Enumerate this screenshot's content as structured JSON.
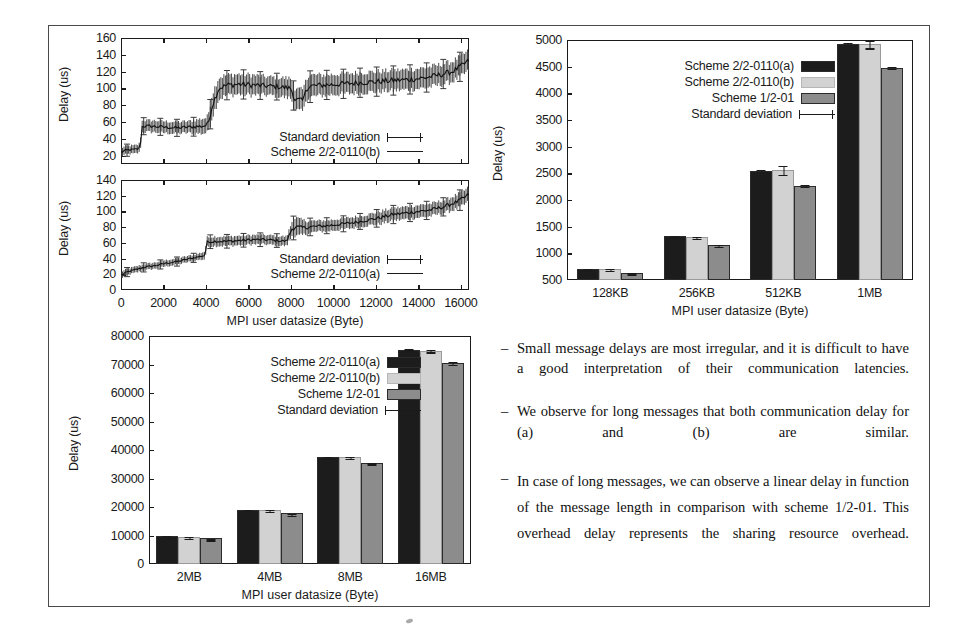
{
  "figure": {
    "axis_color": "#1a1a1a",
    "colors": {
      "scheme_a": "#1c1c1c",
      "scheme_b": "#d2d2d2",
      "scheme_c": "#8c8c8c",
      "frame": "#4a4a4a"
    }
  },
  "chart_data": [
    {
      "id": "line-top",
      "type": "line",
      "title": "",
      "xlabel": "",
      "ylabel": "Delay (us)",
      "xlim": [
        0,
        16384
      ],
      "ylim": [
        10,
        160
      ],
      "yticks": [
        "20",
        "40",
        "60",
        "80",
        "100",
        "120",
        "140",
        "160"
      ],
      "xticks": [],
      "grid": false,
      "legend_position": "bottom-right",
      "legend": [
        "Standard deviation",
        "Scheme 2/2-0110(b)"
      ],
      "series": [
        {
          "name": "Scheme 2/2-0110(b)",
          "x": [
            0,
            200,
            400,
            600,
            800,
            900,
            1000,
            1400,
            2000,
            2600,
            3200,
            3800,
            4000,
            4100,
            4300,
            4600,
            5000,
            5600,
            6200,
            6800,
            7400,
            8000,
            8200,
            8400,
            8500,
            8600,
            8700,
            9000,
            9600,
            10200,
            10800,
            11400,
            12000,
            12600,
            13200,
            13800,
            14400,
            15000,
            15600,
            16100,
            16384
          ],
          "values": [
            24,
            26,
            27,
            27,
            28,
            30,
            55,
            55,
            54,
            53,
            54,
            55,
            56,
            58,
            80,
            100,
            104,
            105,
            104,
            103,
            102,
            100,
            86,
            86,
            85,
            86,
            100,
            103,
            104,
            105,
            106,
            107,
            108,
            109,
            110,
            111,
            113,
            116,
            120,
            128,
            133
          ],
          "std": [
            5,
            5,
            5,
            5,
            5,
            6,
            7,
            7,
            7,
            7,
            7,
            9,
            9,
            10,
            14,
            13,
            12,
            12,
            12,
            11,
            11,
            12,
            12,
            13,
            13,
            13,
            13,
            13,
            12,
            12,
            12,
            12,
            12,
            12,
            12,
            12,
            12,
            12,
            12,
            12,
            12
          ]
        }
      ]
    },
    {
      "id": "line-bottom",
      "type": "line",
      "title": "",
      "xlabel": "MPI user datasize (Byte)",
      "ylabel": "Delay (us)",
      "xlim": [
        0,
        16384
      ],
      "ylim": [
        0,
        140
      ],
      "yticks": [
        "0",
        "20",
        "40",
        "60",
        "80",
        "100",
        "120",
        "140"
      ],
      "xticks": [
        "0",
        "2000",
        "4000",
        "6000",
        "8000",
        "10000",
        "12000",
        "14000",
        "16000"
      ],
      "grid": false,
      "legend_position": "bottom-right",
      "legend": [
        "Standard deviation",
        "Scheme 2/2-0110(a)"
      ],
      "series": [
        {
          "name": "Scheme 2/2-0110(a)",
          "x": [
            0,
            300,
            700,
            1100,
            1600,
            2100,
            2600,
            3100,
            3600,
            3950,
            4050,
            4400,
            5000,
            5600,
            6200,
            6800,
            7300,
            7800,
            8050,
            8200,
            8500,
            8800,
            9200,
            9800,
            10400,
            11000,
            11600,
            12200,
            12800,
            13400,
            14000,
            14600,
            15200,
            15800,
            16200,
            16384
          ],
          "values": [
            19,
            23,
            26,
            29,
            31,
            34,
            36,
            39,
            42,
            44,
            61,
            62,
            62,
            63,
            64,
            64,
            63,
            62,
            78,
            80,
            79,
            80,
            81,
            82,
            84,
            86,
            89,
            92,
            96,
            98,
            100,
            102,
            106,
            112,
            118,
            122
          ],
          "std": [
            4,
            4,
            4,
            4,
            4,
            4,
            4,
            4,
            4,
            5,
            6,
            6,
            6,
            6,
            6,
            6,
            6,
            6,
            9,
            12,
            10,
            8,
            7,
            7,
            7,
            7,
            7,
            8,
            8,
            8,
            8,
            8,
            8,
            9,
            9,
            9
          ]
        }
      ]
    },
    {
      "id": "bar-kb",
      "type": "bar",
      "title": "",
      "xlabel": "MPI user datasize (Byte)",
      "ylabel": "Delay (us)",
      "categories": [
        "128KB",
        "256KB",
        "512KB",
        "1MB"
      ],
      "ylim": [
        500,
        5000
      ],
      "yticks": [
        "500",
        "1000",
        "1500",
        "2000",
        "2500",
        "3000",
        "3500",
        "4000",
        "4500",
        "5000"
      ],
      "grid": false,
      "legend_position": "top-center",
      "series": [
        {
          "name": "Scheme 2/2-0110(a)",
          "values": [
            710,
            1320,
            2550,
            4930
          ],
          "std": [
            15,
            15,
            25,
            30
          ]
        },
        {
          "name": "Scheme 2/2-0110(b)",
          "values": [
            705,
            1310,
            2560,
            4920
          ],
          "std": [
            22,
            20,
            90,
            80
          ]
        },
        {
          "name": "Scheme 1/2-01",
          "values": [
            630,
            1165,
            2270,
            4480
          ],
          "std": [
            12,
            12,
            25,
            30
          ]
        }
      ]
    },
    {
      "id": "bar-mb",
      "type": "bar",
      "title": "",
      "xlabel": "MPI user datasize (Byte)",
      "ylabel": "Delay (us)",
      "categories": [
        "2MB",
        "4MB",
        "8MB",
        "16MB"
      ],
      "ylim": [
        0,
        80000
      ],
      "yticks": [
        "0",
        "10000",
        "20000",
        "30000",
        "40000",
        "50000",
        "60000",
        "70000",
        "80000"
      ],
      "grid": false,
      "legend_position": "top-center",
      "series": [
        {
          "name": "Scheme 2/2-0110(a)",
          "values": [
            9800,
            19100,
            37600,
            75200
          ],
          "std": [
            250,
            250,
            350,
            450
          ]
        },
        {
          "name": "Scheme 2/2-0110(b)",
          "values": [
            9650,
            18900,
            37500,
            74900
          ],
          "std": [
            200,
            300,
            400,
            700
          ]
        },
        {
          "name": "Scheme 1/2-01",
          "values": [
            9100,
            17800,
            35300,
            70500
          ],
          "std": [
            180,
            200,
            350,
            600
          ]
        }
      ]
    }
  ],
  "legends": {
    "line_top": {
      "std": "Standard deviation",
      "scheme": "Scheme 2/2-0110(b)"
    },
    "line_bottom": {
      "std": "Standard deviation",
      "scheme": "Scheme 2/2-0110(a)"
    },
    "bars": {
      "scheme_a": "Scheme 2/2-0110(a)",
      "scheme_b": "Scheme 2/2-0110(b)",
      "scheme_c": "Scheme 1/2-01",
      "std": "Standard deviation"
    }
  },
  "axis_titles": {
    "delay": "Delay (us)",
    "datasize": "MPI user datasize (Byte)"
  },
  "notes": [
    {
      "dash": "–",
      "text": "Small message delays are most irregular, and it is difficult to have a good interpretation of their communication latencies."
    },
    {
      "dash": "–",
      "text": "We observe for long messages that both communication delay for (a) and (b) are similar."
    },
    {
      "dash": "–",
      "text": "In case of long messages, we can observe a linear delay in function of the message length in comparison with scheme 1/2-01. This overhead delay represents the sharing resource overhead."
    }
  ]
}
